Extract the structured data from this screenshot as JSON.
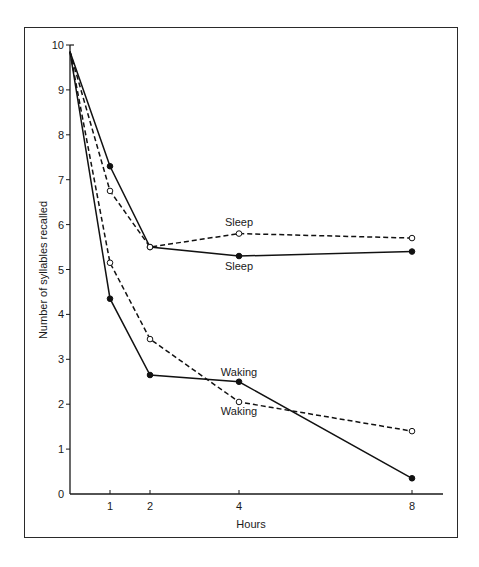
{
  "chart_data": {
    "type": "line",
    "title": "",
    "xlabel": "Hours",
    "ylabel": "Number of syllables recalled",
    "x_ticks": [
      "1",
      "2",
      "4",
      "8"
    ],
    "y_ticks": [
      "0",
      "1",
      "2",
      "3",
      "4",
      "5",
      "6",
      "7",
      "8",
      "9",
      "10"
    ],
    "xlim": [
      0,
      8.7
    ],
    "ylim": [
      0,
      10
    ],
    "grid": false,
    "legend": "inline labels",
    "x": [
      0,
      1,
      2,
      4,
      8
    ],
    "series": [
      {
        "name": "Sleep",
        "style": "solid",
        "marker": "filled-circle",
        "values": [
          9.85,
          7.3,
          5.5,
          5.3,
          5.4
        ]
      },
      {
        "name": "Sleep",
        "style": "dashed",
        "marker": "open-circle",
        "values": [
          9.85,
          6.75,
          5.5,
          5.8,
          5.7
        ]
      },
      {
        "name": "Waking",
        "style": "solid",
        "marker": "filled-circle",
        "values": [
          9.85,
          4.35,
          2.65,
          2.5,
          0.35
        ]
      },
      {
        "name": "Waking",
        "style": "dashed",
        "marker": "open-circle",
        "values": [
          9.85,
          5.15,
          3.45,
          2.05,
          1.4
        ]
      }
    ],
    "annotations": [
      {
        "text": "Sleep",
        "near": "dashed sleep at 4h (above)"
      },
      {
        "text": "Sleep",
        "near": "solid sleep at 4h (below)"
      },
      {
        "text": "Waking",
        "near": "solid waking at 4h (above)"
      },
      {
        "text": "Waking",
        "near": "dashed waking at 4h (below)"
      }
    ]
  },
  "labels": {
    "sleep_top": "Sleep",
    "sleep_bottom": "Sleep",
    "waking_top": "Waking",
    "waking_bottom": "Waking",
    "xlabel": "Hours",
    "ylabel": "Number of syllables recalled"
  }
}
